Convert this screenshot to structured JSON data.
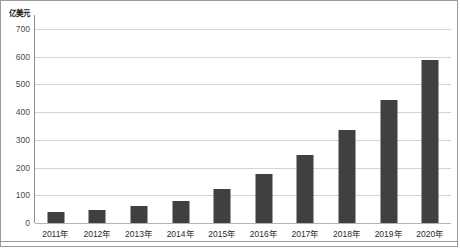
{
  "chart_data": {
    "type": "bar",
    "title": "",
    "subtitle": "",
    "xlabel": "",
    "ylabel": "亿美元",
    "ylim": [
      0,
      700
    ],
    "yticks": [
      0,
      100,
      200,
      300,
      400,
      500,
      600,
      700
    ],
    "grid": true,
    "legend": null,
    "bar_color": "#404040",
    "gridline_color": "#d4d4d4",
    "categories": [
      "2011年",
      "2012年",
      "2013年",
      "2014年",
      "2015年",
      "2016年",
      "2017年",
      "2018年",
      "2019年",
      "2020年"
    ],
    "values": [
      40,
      48,
      62,
      80,
      122,
      178,
      245,
      335,
      445,
      590
    ],
    "series": [
      {
        "name": "",
        "values": [
          40,
          48,
          62,
          80,
          122,
          178,
          245,
          335,
          445,
          590
        ]
      }
    ]
  }
}
